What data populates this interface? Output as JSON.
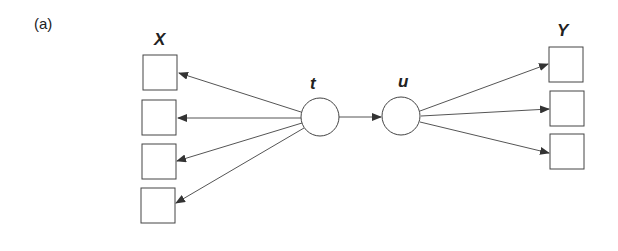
{
  "panel_label": "(a)",
  "groups": {
    "left": {
      "label": "X",
      "box_count": 4
    },
    "right": {
      "label": "Y",
      "box_count": 3
    }
  },
  "nodes": {
    "t": {
      "label": "t"
    },
    "u": {
      "label": "u"
    }
  },
  "edges": [
    {
      "from": "t",
      "to": "X1"
    },
    {
      "from": "t",
      "to": "X2"
    },
    {
      "from": "t",
      "to": "X3"
    },
    {
      "from": "t",
      "to": "X4"
    },
    {
      "from": "t",
      "to": "u"
    },
    {
      "from": "u",
      "to": "Y1"
    },
    {
      "from": "u",
      "to": "Y2"
    },
    {
      "from": "u",
      "to": "Y3"
    }
  ],
  "colors": {
    "stroke": "#333333",
    "fill": "#ffffff"
  }
}
